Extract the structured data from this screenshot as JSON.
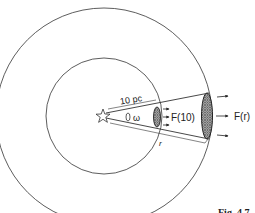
{
  "figure": {
    "caption": "Fig. 4.7",
    "labels": {
      "distance": "10 pc",
      "solid_angle": "ω",
      "flux_near": "F(10)",
      "flux_far": "F(r)",
      "radius": "r"
    },
    "elements": {
      "source": "star",
      "inner_sphere_radius": "10 pc",
      "outer_sphere_radius": "r"
    },
    "colors": {
      "line": "#333333",
      "hatch": "#888888",
      "background": "#ffffff"
    }
  }
}
